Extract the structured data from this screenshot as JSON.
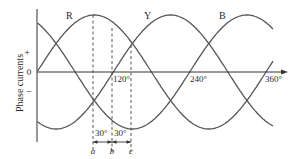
{
  "chart_data": {
    "type": "line",
    "title": "",
    "xlabel": "",
    "ylabel": "Phase currents",
    "x_ticks": [
      "120°",
      "240°",
      "360°"
    ],
    "y_ticks": [
      "+",
      "0",
      "−"
    ],
    "series": [
      {
        "name": "R",
        "phase_shift_deg": 0,
        "function": "sin(θ)"
      },
      {
        "name": "Y",
        "phase_shift_deg": -120,
        "function": "sin(θ − 120°)"
      },
      {
        "name": "B",
        "phase_shift_deg": -240,
        "function": "sin(θ − 240°)"
      }
    ],
    "xlim": [
      0,
      360
    ],
    "annotations": {
      "markers": [
        {
          "label": "a",
          "angle_deg": 90
        },
        {
          "label": "b",
          "angle_deg": 120
        },
        {
          "label": "c",
          "angle_deg": 150
        }
      ],
      "intervals": [
        {
          "label": "30°",
          "from": "a",
          "to": "b"
        },
        {
          "label": "30°",
          "from": "b",
          "to": "c"
        }
      ]
    }
  },
  "labels": {
    "ylabel": "Phase currents",
    "plus": "+",
    "zero": "0",
    "minus": "−",
    "t120": "120°",
    "t240": "240°",
    "t360": "360°",
    "R": "R",
    "Y": "Y",
    "B": "B",
    "int1": "30°",
    "int2": "30°",
    "a": "a",
    "b": "b",
    "c": "c"
  }
}
